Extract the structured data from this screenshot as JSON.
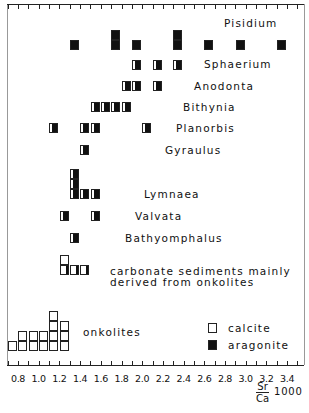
{
  "chart_data": {
    "type": "histogram",
    "title": "",
    "xlabel": "Sr/Ca 1000",
    "xlabel_numerator": "Sr",
    "xlabel_denominator": "Ca",
    "xlabel_multiplier": "1000",
    "ylabel": "",
    "xlim": [
      0.7,
      3.5
    ],
    "x_tick_step": 0.1,
    "x_tick_labels": [
      "0.8",
      "1.0",
      "1.2",
      "1.4",
      "1.6",
      "1.8",
      "2.0",
      "2.2",
      "2.4",
      "2.6",
      "2.8",
      "3.0",
      "3.2",
      "3.4"
    ],
    "grid": false,
    "legend": [
      {
        "label": "calcite",
        "fill": "#ffffff"
      },
      {
        "label": "aragonite",
        "fill": "#111111"
      }
    ],
    "legend_position": "bottom-right",
    "groups": [
      {
        "name": "Pisidium",
        "material": "aragonite",
        "samples": [
          {
            "x": 1.35,
            "count": 1
          },
          {
            "x": 1.75,
            "count": 2
          },
          {
            "x": 1.95,
            "count": 1
          },
          {
            "x": 2.35,
            "count": 2
          },
          {
            "x": 2.65,
            "count": 1
          },
          {
            "x": 2.95,
            "count": 1
          },
          {
            "x": 3.35,
            "count": 1
          }
        ]
      },
      {
        "name": "Sphaerium",
        "material": "aragonite",
        "samples": [
          {
            "x": 1.95,
            "count": 1
          },
          {
            "x": 2.15,
            "count": 1
          },
          {
            "x": 2.35,
            "count": 1
          }
        ]
      },
      {
        "name": "Anodonta",
        "material": "aragonite",
        "samples": [
          {
            "x": 1.85,
            "count": 1
          },
          {
            "x": 1.95,
            "count": 1
          },
          {
            "x": 2.15,
            "count": 1
          }
        ]
      },
      {
        "name": "Bithynia",
        "material": "aragonite",
        "samples": [
          {
            "x": 1.55,
            "count": 1
          },
          {
            "x": 1.65,
            "count": 1
          },
          {
            "x": 1.75,
            "count": 1
          },
          {
            "x": 1.85,
            "count": 1
          }
        ]
      },
      {
        "name": "Planorbis",
        "material": "aragonite",
        "samples": [
          {
            "x": 1.15,
            "count": 1
          },
          {
            "x": 1.45,
            "count": 1
          },
          {
            "x": 1.55,
            "count": 1
          },
          {
            "x": 2.05,
            "count": 1
          }
        ]
      },
      {
        "name": "Gyraulus",
        "material": "aragonite",
        "samples": [
          {
            "x": 1.45,
            "count": 1
          }
        ]
      },
      {
        "name": "Lymnaea",
        "material": "aragonite",
        "samples": [
          {
            "x": 1.35,
            "count": 3
          },
          {
            "x": 1.45,
            "count": 1
          },
          {
            "x": 1.55,
            "count": 1
          }
        ]
      },
      {
        "name": "Valvata",
        "material": "aragonite",
        "samples": [
          {
            "x": 1.25,
            "count": 1
          },
          {
            "x": 1.55,
            "count": 1
          }
        ]
      },
      {
        "name": "Bathyomphalus",
        "material": "aragonite",
        "samples": [
          {
            "x": 1.35,
            "count": 1
          }
        ]
      },
      {
        "name": "carbonate sediments mainly derived from onkolites",
        "material": "calcite",
        "samples": [
          {
            "x": 1.25,
            "count": 2
          },
          {
            "x": 1.35,
            "count": 1
          },
          {
            "x": 1.45,
            "count": 1
          }
        ]
      },
      {
        "name": "onkolites",
        "material": "calcite",
        "samples": [
          {
            "x": 0.75,
            "count": 1
          },
          {
            "x": 0.85,
            "count": 2
          },
          {
            "x": 0.95,
            "count": 2
          },
          {
            "x": 1.05,
            "count": 2
          },
          {
            "x": 1.15,
            "count": 4
          },
          {
            "x": 1.25,
            "count": 3
          }
        ]
      }
    ]
  },
  "labels": {
    "pisidium": "Pisidium",
    "sphaerium": "Sphaerium",
    "anodonta": "Anodonta",
    "bithynia": "Bithynia",
    "planorbis": "Planorbis",
    "gyraulus": "Gyraulus",
    "lymnaea": "Lymnaea",
    "valvata": "Valvata",
    "bathyomphalus": "Bathyomphalus",
    "carbonate_line1": "carbonate sediments mainly",
    "carbonate_line2": "derived from onkolites",
    "onkolites": "onkolites",
    "legend_calcite": "calcite",
    "legend_aragonite": "aragonite",
    "axis_num": "Sr",
    "axis_den": "Ca",
    "axis_mult": "1000"
  }
}
